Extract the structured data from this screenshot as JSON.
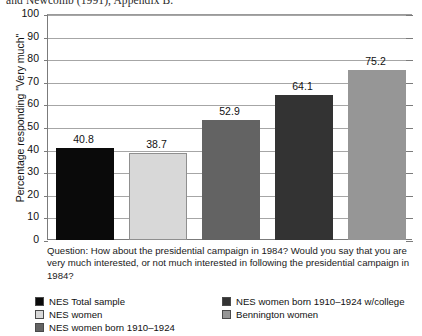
{
  "top_caption": "and Newcomb (1991), Appendix B.",
  "question_box": {
    "text": "Question: How about the presidential campaign in 1984? Would you say that you are very much interested, or not much interested in following the presidential campaign in 1984?"
  },
  "chart_data": {
    "type": "bar",
    "title": "",
    "xlabel": "",
    "ylabel": "Percentage responding \"Very much\"",
    "ylim": [
      0,
      100
    ],
    "yticks": [
      0,
      10,
      20,
      30,
      40,
      50,
      60,
      70,
      80,
      90,
      100
    ],
    "grid": true,
    "legend_position": "bottom",
    "categories": [
      "NES Total sample",
      "NES women",
      "NES women born 1910–1924",
      "NES women born 1910–1924 w/college",
      "Bennington women"
    ],
    "values": [
      40.8,
      38.7,
      52.9,
      64.1,
      75.2
    ],
    "value_labels": [
      "40.8",
      "38.7",
      "52.9",
      "64.1",
      "75.2"
    ],
    "colors": [
      "#0a0a0a",
      "#d8d8d8",
      "#636363",
      "#333333",
      "#969696"
    ]
  },
  "legend": {
    "entries": [
      {
        "label": "NES Total sample",
        "color": "#0a0a0a"
      },
      {
        "label": "NES women",
        "color": "#d8d8d8"
      },
      {
        "label": "NES women born 1910–1924",
        "color": "#636363"
      },
      {
        "label": "NES women born 1910–1924 w/college",
        "color": "#333333"
      },
      {
        "label": "Bennington women",
        "color": "#969696"
      }
    ]
  }
}
